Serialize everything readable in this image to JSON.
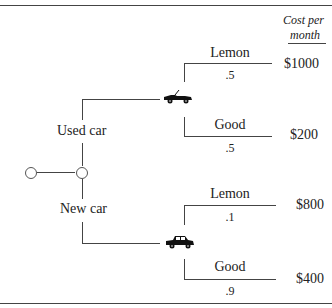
{
  "header": {
    "cost_label_line1": "Cost per",
    "cost_label_line2": "month"
  },
  "tree": {
    "root_node": "decision-node",
    "branches": [
      {
        "label": "Used car",
        "chance_icon": "convertible-car-icon",
        "outcomes": [
          {
            "label": "Lemon",
            "probability": ".5",
            "cost": "$1000"
          },
          {
            "label": "Good",
            "probability": ".5",
            "cost": "$200"
          }
        ]
      },
      {
        "label": "New car",
        "chance_icon": "sedan-car-icon",
        "outcomes": [
          {
            "label": "Lemon",
            "probability": ".1",
            "cost": "$800"
          },
          {
            "label": "Good",
            "probability": ".9",
            "cost": "$400"
          }
        ]
      }
    ]
  },
  "colors": {
    "line": "#444444",
    "text": "#222222",
    "background": "#ffffff"
  }
}
